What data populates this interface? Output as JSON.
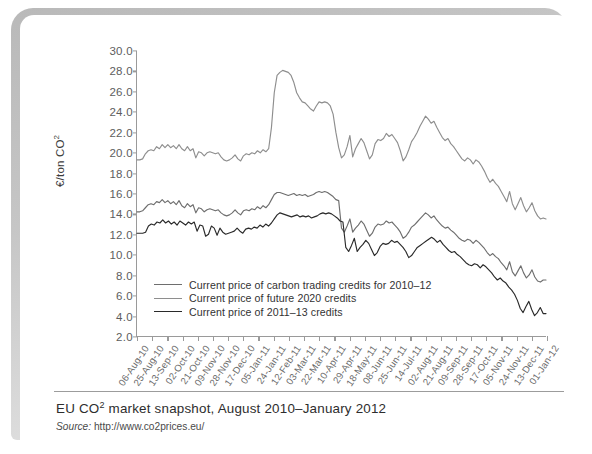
{
  "figure": {
    "caption_pre": "EU CO",
    "caption_sup": "2",
    "caption_post": " market snapshot, August 2010–January 2012",
    "source_label": "Source:",
    "source_url": "http://www.co2prices.eu/"
  },
  "chart_data": {
    "type": "line",
    "title": "EU CO2 market snapshot, August 2010–January 2012",
    "xlabel": "",
    "ylabel_pre": "€/ton CO",
    "ylabel_sup": "2",
    "ylabel": "€/ton CO2",
    "ylim": [
      2.0,
      30.0
    ],
    "ytick_labels": [
      "30.0",
      "28.0",
      "26.0",
      "24.0",
      "22.0",
      "20.0",
      "18.0",
      "16.0",
      "14.0",
      "12.0",
      "10.0",
      "8.0",
      "6.0",
      "4.0",
      "2.0"
    ],
    "yticks": [
      30.0,
      28.0,
      26.0,
      24.0,
      22.0,
      20.0,
      18.0,
      16.0,
      14.0,
      12.0,
      10.0,
      8.0,
      6.0,
      4.0,
      2.0
    ],
    "grid": false,
    "legend_position": "inside-lower-left",
    "xtick_labels": [
      "06-Aug-10",
      "25-Aug-10",
      "13-Sep-10",
      "02-Oct-10",
      "21-Oct-10",
      "09-Nov-10",
      "28-Nov-10",
      "17-Dec-10",
      "05-Jan-11",
      "24-Jan-11",
      "12-Feb-11",
      "03-Mar-11",
      "22-Mar-11",
      "10-Apr-11",
      "29-Apr-11",
      "18-May-11",
      "08-Jun-11",
      "25-Jun-11",
      "14-Jul-11",
      "02-Aug-11",
      "21-Aug-11",
      "09-Sep-11",
      "28-Sep-11",
      "17-Oct-11",
      "05-Nov-11",
      "24-Nov-11",
      "13-Dec-11",
      "01-Jan-12"
    ],
    "series": [
      {
        "name": "Current price of future 2020 credits",
        "color": "#8e8e8e",
        "values": [
          19.3,
          19.3,
          19.4,
          19.9,
          20.2,
          20.3,
          20.2,
          20.6,
          20.4,
          20.8,
          20.5,
          20.8,
          20.5,
          20.7,
          20.4,
          20.8,
          20.4,
          20.2,
          20.6,
          20.2,
          20.4,
          19.5,
          20.1,
          20.0,
          19.7,
          20.0,
          20.1,
          20.0,
          19.9,
          20.0,
          19.6,
          19.3,
          19.2,
          19.3,
          19.5,
          19.8,
          19.4,
          19.2,
          19.7,
          19.9,
          19.8,
          20.0,
          19.9,
          20.2,
          20.0,
          20.3,
          20.1,
          20.4,
          22.5,
          25.9,
          27.6,
          27.9,
          28.1,
          28.0,
          27.9,
          27.6,
          26.9,
          25.9,
          25.4,
          25.0,
          24.9,
          24.6,
          24.3,
          24.1,
          24.6,
          25.0,
          24.9,
          25.0,
          24.9,
          24.6,
          23.8,
          22.0,
          20.5,
          19.5,
          19.8,
          20.6,
          21.7,
          19.6,
          20.4,
          20.9,
          21.4,
          21.0,
          20.2,
          19.4,
          19.8,
          20.9,
          21.3,
          21.2,
          21.4,
          21.9,
          21.6,
          21.8,
          21.4,
          21.0,
          20.2,
          19.2,
          19.6,
          20.3,
          21.1,
          21.5,
          22.0,
          22.6,
          23.1,
          23.6,
          23.3,
          22.9,
          23.1,
          22.5,
          22.0,
          21.5,
          21.2,
          21.4,
          20.9,
          20.6,
          20.2,
          19.8,
          19.4,
          19.2,
          19.5,
          19.3,
          18.9,
          19.3,
          19.1,
          18.7,
          18.2,
          17.6,
          17.1,
          17.4,
          17.0,
          16.7,
          16.2,
          15.7,
          15.2,
          16.2,
          15.0,
          14.4,
          15.0,
          15.6,
          14.8,
          14.2,
          14.6,
          15.1,
          14.3,
          13.8,
          13.5,
          13.6,
          13.5
        ]
      },
      {
        "name": "Current price of carbon trading credits for 2010–12",
        "color": "#6e6e6e",
        "values": [
          14.2,
          14.2,
          14.3,
          14.6,
          14.9,
          15.0,
          14.9,
          15.2,
          15.1,
          15.4,
          15.1,
          15.3,
          15.0,
          15.2,
          14.9,
          15.3,
          14.8,
          14.6,
          15.0,
          14.7,
          14.9,
          14.1,
          14.6,
          14.5,
          14.2,
          14.4,
          14.5,
          14.4,
          14.3,
          14.4,
          14.1,
          13.9,
          13.8,
          13.9,
          14.1,
          14.4,
          14.1,
          13.9,
          14.3,
          14.4,
          14.3,
          14.5,
          14.4,
          14.7,
          14.5,
          14.8,
          14.6,
          14.9,
          15.4,
          15.9,
          16.1,
          16.1,
          16.0,
          15.9,
          15.8,
          15.9,
          16.0,
          15.8,
          15.9,
          15.8,
          15.9,
          15.7,
          15.8,
          15.9,
          16.1,
          16.2,
          16.1,
          16.2,
          16.1,
          15.9,
          15.7,
          15.4,
          15.3,
          12.6,
          12.2,
          12.8,
          13.5,
          12.2,
          12.6,
          12.9,
          13.3,
          13.0,
          12.4,
          11.8,
          12.1,
          12.7,
          13.0,
          12.9,
          13.0,
          13.3,
          13.1,
          13.2,
          12.9,
          12.6,
          12.2,
          11.6,
          11.8,
          12.2,
          12.7,
          12.9,
          13.2,
          13.5,
          13.8,
          14.1,
          13.9,
          13.6,
          13.8,
          13.4,
          13.1,
          12.8,
          12.6,
          12.7,
          12.4,
          12.2,
          11.9,
          11.6,
          11.4,
          11.3,
          11.5,
          11.4,
          11.1,
          11.4,
          11.2,
          10.9,
          10.6,
          10.2,
          9.9,
          10.1,
          9.8,
          9.6,
          9.2,
          8.9,
          8.5,
          9.3,
          8.3,
          7.9,
          8.4,
          8.9,
          8.2,
          7.7,
          8.0,
          8.5,
          7.8,
          7.4,
          7.3,
          7.5,
          7.5
        ]
      },
      {
        "name": "Current price of 2011–13 credits",
        "color": "#2a2a2a",
        "values": [
          12.1,
          12.1,
          12.1,
          12.2,
          12.8,
          13.0,
          12.9,
          13.2,
          13.1,
          13.4,
          13.1,
          13.3,
          13.0,
          13.2,
          12.9,
          13.3,
          13.1,
          12.9,
          13.2,
          13.0,
          13.2,
          12.3,
          12.9,
          12.8,
          11.8,
          12.0,
          12.8,
          12.6,
          11.9,
          12.6,
          12.2,
          12.0,
          12.1,
          12.2,
          12.3,
          12.6,
          12.3,
          12.1,
          12.5,
          12.6,
          12.5,
          12.7,
          12.6,
          12.9,
          12.7,
          13.0,
          12.8,
          13.1,
          13.5,
          13.9,
          14.1,
          14.0,
          13.9,
          13.8,
          13.7,
          13.8,
          13.9,
          13.7,
          13.8,
          13.7,
          13.8,
          13.6,
          13.7,
          13.8,
          14.0,
          14.1,
          14.0,
          14.1,
          14.0,
          13.8,
          13.6,
          13.3,
          13.2,
          10.7,
          10.3,
          10.9,
          11.6,
          10.3,
          10.7,
          11.0,
          11.4,
          11.1,
          10.5,
          9.9,
          10.2,
          10.8,
          11.1,
          11.0,
          11.1,
          11.4,
          11.2,
          11.3,
          11.0,
          10.7,
          10.3,
          9.7,
          9.9,
          10.3,
          10.7,
          10.9,
          11.1,
          11.3,
          11.5,
          11.7,
          11.5,
          11.2,
          11.4,
          11.0,
          10.7,
          10.4,
          10.2,
          10.3,
          10.0,
          9.8,
          9.5,
          9.2,
          9.0,
          8.9,
          9.1,
          9.0,
          8.7,
          9.0,
          8.8,
          8.5,
          8.2,
          7.8,
          7.5,
          7.7,
          7.4,
          7.2,
          6.8,
          6.5,
          6.1,
          5.5,
          4.7,
          4.3,
          4.9,
          5.4,
          4.6,
          4.0,
          4.3,
          4.8,
          4.2,
          4.2
        ]
      }
    ]
  },
  "legend": [
    {
      "label": "Current price of carbon trading credits for 2010–12",
      "color": "#6e6e6e"
    },
    {
      "label": "Current price of future 2020 credits",
      "color": "#8e8e8e"
    },
    {
      "label": "Current price of 2011–13 credits",
      "color": "#2a2a2a"
    }
  ]
}
